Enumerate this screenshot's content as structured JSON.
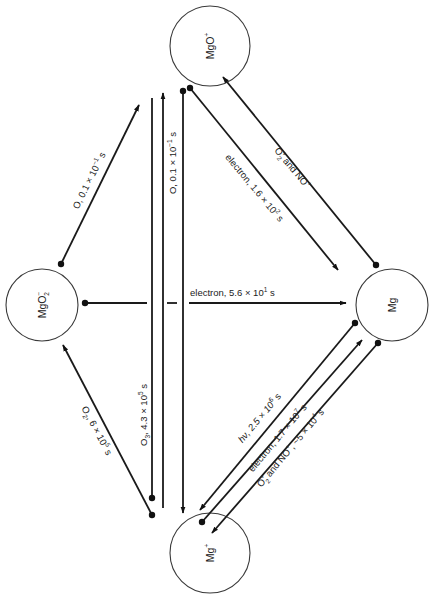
{
  "diagram": {
    "type": "reaction-pathway",
    "nodes": [
      {
        "id": "mgo_plus",
        "label": "MgO",
        "charge": "+",
        "cx": 210,
        "cy": 46,
        "r": 40
      },
      {
        "id": "mgo2_minus",
        "label": "MgO",
        "sub": "2",
        "charge": "−",
        "cx": 42,
        "cy": 305,
        "r": 36
      },
      {
        "id": "mg",
        "label": "Mg",
        "charge": "",
        "cx": 392,
        "cy": 305,
        "r": 36
      },
      {
        "id": "mg_plus",
        "label": "Mg",
        "charge": "+",
        "cx": 210,
        "cy": 553,
        "r": 40
      }
    ],
    "edges": [
      {
        "from": "mgo2_minus",
        "to": "mgo_plus",
        "reactant": "O",
        "label": "O, 0.1 × 10⁻¹ s"
      },
      {
        "from": "mg_plus",
        "to": "mgo_plus",
        "reactant": "O",
        "label": "O, 0.1 × 10⁻¹ s"
      },
      {
        "from": "mgo_plus",
        "to": "mg",
        "reactant": "electron",
        "label": "electron, 1.6 × 10² s"
      },
      {
        "from": "mg",
        "to": "mgo_plus",
        "reactant": "O₂⁺ and NO⁺",
        "label": "O₂⁺ and NO⁺"
      },
      {
        "from": "mgo2_minus",
        "to": "mg",
        "reactant": "electron",
        "label": "electron, 5.6 × 10¹ s"
      },
      {
        "from": "mg_plus",
        "to": "mgo2_minus",
        "reactant": "O₂",
        "label": "O₂, 6 × 10⁵ s"
      },
      {
        "from": "mgo_plus",
        "to": "mg_plus",
        "reactant": "O₃",
        "label": "O₃, 4.3 × 10⁵ s"
      },
      {
        "from": "mg",
        "to": "mg_plus",
        "reactant": "hν",
        "label": "hν, 2.5 × 10⁶ s"
      },
      {
        "from": "mg_plus",
        "to": "mg",
        "reactant": "electron",
        "label": "electron, 1.7 × 10⁷ s"
      },
      {
        "from": "mg",
        "to": "mg_plus",
        "reactant": "O₂⁺ and NO⁺",
        "label": "O₂⁺ and NO⁺, ~5 × 10⁴ s"
      }
    ]
  },
  "labels": {
    "node_mgo_plus": "MgO",
    "node_mgo_plus_charge": "+",
    "node_mgo2": "MgO",
    "node_mgo2_sub": "2",
    "node_mgo2_charge": "−",
    "node_mg": "Mg",
    "node_mg_plus": "Mg",
    "node_mg_plus_charge": "+",
    "edge_mgo2_mgo_plus": "O, 0.1 × 10",
    "edge_mgo2_mgo_plus_exp": "−1",
    "edge_mgo2_mgo_plus_unit": " s",
    "edge_vertical_o": "O, 0.1 × 10",
    "edge_vertical_o_exp": "−1",
    "edge_vertical_o_unit": " s",
    "edge_electron_mgo_mg": "electron, 1.6 × 10",
    "edge_electron_mgo_mg_exp": "2",
    "edge_electron_mgo_mg_unit": " s",
    "edge_o2nop_mg_mgo": "O",
    "edge_o2nop_mg_mgo_sub": "2",
    "edge_o2nop_mg_mgo_sup": "+",
    "edge_o2nop_mg_mgo_rest": " and NO",
    "edge_o2nop_mg_mgo_rest_sup": "+",
    "edge_electron_horizontal": "electron,  5.6 × 10",
    "edge_electron_horizontal_exp": "1",
    "edge_electron_horizontal_unit": " s",
    "edge_o2_mgplus_mgo2": "O",
    "edge_o2_mgplus_mgo2_sub": "2",
    "edge_o2_mgplus_mgo2_rest": ", 6 × 10",
    "edge_o2_mgplus_mgo2_exp": "5",
    "edge_o2_mgplus_mgo2_unit": " s",
    "edge_o3": "O",
    "edge_o3_sub": "3",
    "edge_o3_rest": ", 4.3 × 10",
    "edge_o3_exp": "5",
    "edge_o3_unit": " s",
    "edge_hv": "hν, 2.5 × 10",
    "edge_hv_exp": "6",
    "edge_hv_unit": " s",
    "edge_electron_mgplus_mg": "electron, 1.7 × 10",
    "edge_electron_mgplus_mg_exp": "7",
    "edge_electron_mgplus_mg_unit": " s",
    "edge_o2nop_mg_mgplus": "O",
    "edge_o2nop_mg_mgplus_sub": "2",
    "edge_o2nop_mg_mgplus_sup": "+",
    "edge_o2nop_mg_mgplus_rest": " and NO",
    "edge_o2nop_mg_mgplus_rest_sup": "+",
    "edge_o2nop_mg_mgplus_tail": ", ~5 × 10",
    "edge_o2nop_mg_mgplus_exp": "4",
    "edge_o2nop_mg_mgplus_unit": " s"
  },
  "colors": {
    "background": "#ffffff",
    "line": "#1a1a1a",
    "text": "#222222"
  }
}
